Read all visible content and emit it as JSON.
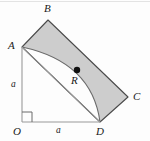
{
  "figure": {
    "type": "geometry-diagram",
    "background_color": "#fdfdfd",
    "shade_color": "#cdcdcd",
    "stroke_color": "#4a4a4a",
    "label_color": "#1a1a1a",
    "width": 150,
    "height": 141,
    "vertices": {
      "O": {
        "label": "O",
        "x": 22,
        "y": 122,
        "label_x": 13,
        "label_y": 126
      },
      "A": {
        "label": "A",
        "x": 22,
        "y": 47,
        "label_x": 8,
        "label_y": 40
      },
      "B": {
        "label": "B",
        "x": 48,
        "y": 20,
        "label_x": 44,
        "label_y": 4
      },
      "C": {
        "label": "C",
        "x": 128,
        "y": 97,
        "label_x": 133,
        "label_y": 91
      },
      "D": {
        "label": "D",
        "x": 100,
        "y": 122,
        "label_x": 97,
        "label_y": 126
      },
      "R": {
        "label": "R",
        "x": 77,
        "y": 70,
        "label_x": 71,
        "label_y": 76
      }
    },
    "side_labels": [
      {
        "name": "vertical-side-a",
        "text": "a",
        "x": 11,
        "y": 81
      },
      {
        "name": "horizontal-side-a",
        "text": "a",
        "x": 56,
        "y": 126
      }
    ],
    "marks": {
      "right_angle_at": "O",
      "right_angle_size": 10,
      "point_radius": 3.2
    },
    "paths": {
      "square_ABCD": "M22,47 L48,20 L128,97 L100,122 Z",
      "arc_A_to_D": "M22,47 Q92,62 100,122",
      "diagonal_A_to_D": "M22,47 L100,122",
      "axis_vertical_OA": "M22,122 L22,47",
      "axis_horizontal_OD": "M22,122 L100,122"
    }
  }
}
